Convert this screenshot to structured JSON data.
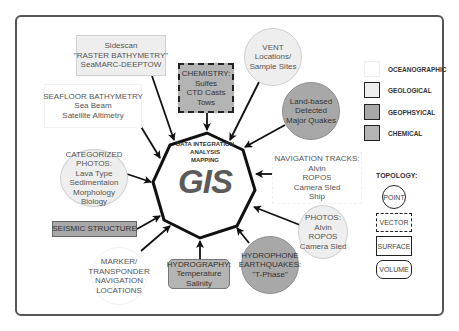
{
  "center": {
    "line1": "DATA INTEGRATION",
    "line2": "ANALYSIS",
    "line3": "MAPPING",
    "title": "GIS"
  },
  "nodes": {
    "sidescan": {
      "lines": [
        "Sidescan",
        "\"RASTER BATHYMETRY\"",
        "SeaMARC-DEEPTOW"
      ],
      "category": "geological",
      "topology": "surface"
    },
    "seafloor_bathymetry": {
      "lines": [
        "SEAFLOOR BATHYMETRY",
        "Sea Beam",
        "Satellite Altimetry"
      ],
      "category": "oceanographic",
      "topology": "surface"
    },
    "chemistry": {
      "lines": [
        "CHEMISTRY:",
        "Sulfes",
        "CTD Casts",
        "Tows"
      ],
      "category": "chemical",
      "topology": "vector"
    },
    "vent": {
      "lines": [
        "VENT",
        "Locations/",
        "Sample Sites"
      ],
      "category": "geological",
      "topology": "point"
    },
    "land_based": {
      "lines": [
        "Land-based",
        "Detected",
        "Major Quakes"
      ],
      "category": "geophysical",
      "topology": "point"
    },
    "categorized_photos": {
      "lines": [
        "CATEGORIZED",
        "PHOTOS:",
        "Lava Type",
        "Sedimentaion",
        "Morphology",
        "Biology"
      ],
      "category": "geological",
      "topology": "point"
    },
    "navigation_tracks": {
      "lines": [
        "NAVIGATION TRACKS:",
        "Alvin",
        "ROPOS",
        "Camera Sled",
        "Ship"
      ],
      "category": "oceanographic",
      "topology": "vector"
    },
    "seismic_structure": {
      "lines": [
        "SEISMIC STRUCTURE"
      ],
      "category": "geophysical",
      "topology": "surface"
    },
    "photos": {
      "lines": [
        "PHOTOS:",
        "Alvin",
        "ROPOS",
        "Camera Sled"
      ],
      "category": "geological",
      "topology": "point"
    },
    "marker": {
      "lines": [
        "MARKER/",
        "TRANSPONDER",
        "NAVIGATION",
        "LOCATIONS"
      ],
      "category": "oceanographic",
      "topology": "point"
    },
    "hydrography": {
      "lines": [
        "HYDROGRAPHY:",
        "Temperature",
        "Salinity"
      ],
      "category": "chemical",
      "topology": "volume"
    },
    "hydrophone": {
      "lines": [
        "HYDROPHONE",
        "EARTHQUAKES:",
        "\"T-Phase\""
      ],
      "category": "geophysical",
      "topology": "point"
    }
  },
  "legend": {
    "categories": [
      {
        "label": "OCEANOGRAPHIC",
        "color": "#ffffff"
      },
      {
        "label": "GEOLOGICAL",
        "color": "#eeeeee"
      },
      {
        "label": "GEOPHSYICAL",
        "color": "#a8a8a8"
      },
      {
        "label": "CHEMICAL",
        "color": "#b4b4b4"
      }
    ],
    "topology_title": "TOPOLOGY:",
    "topology": [
      {
        "label": "POINT"
      },
      {
        "label": "VECTOR"
      },
      {
        "label": "SURFACE"
      },
      {
        "label": "VOLUME"
      }
    ]
  },
  "colors": {
    "frame": "#555555",
    "arrow": "#111111",
    "octagon_stroke": "#111111"
  }
}
